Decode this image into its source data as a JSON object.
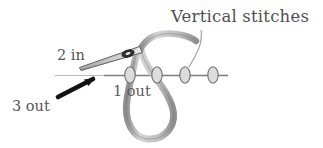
{
  "figure": {
    "title_label": "Vertical stitches",
    "background_color": "#ffffff",
    "ink_color": "#4a4a4a",
    "labels": {
      "vertical_stitches": "Vertical stitches",
      "point_2_in": "2 in",
      "point_1_out": "1 out",
      "point_3_out": "3 out"
    },
    "icons": {
      "needle": "needle-icon",
      "thread_loop": "thread-loop-icon",
      "fabric_line": "fabric-line-icon",
      "arrow": "arrow-icon",
      "leader": "leader-line-icon"
    },
    "stitches": {
      "count": 4,
      "positions_x": [
        130,
        157,
        185,
        213
      ],
      "center_y": 75,
      "rx": 5.2,
      "ry": 8.2,
      "fill_color": "#d9d9d9",
      "stroke_color": "#6a6a6a"
    },
    "fabric_line": {
      "x_start": 55,
      "x_end": 228,
      "y": 75,
      "color": "#8a8a8a"
    }
  }
}
